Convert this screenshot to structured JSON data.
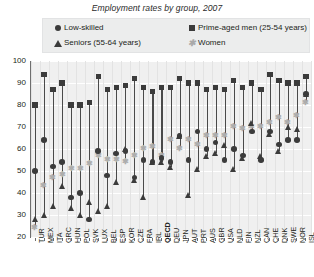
{
  "title": "Employment rates by group, 2007",
  "legend": {
    "position": "top",
    "items": [
      {
        "label": "Low-skilled",
        "marker": "circle-marker",
        "color": "#3b3b3b"
      },
      {
        "label": "Prime-aged men (25-54 years)",
        "marker": "square-marker",
        "color": "#3b3b3b"
      },
      {
        "label": "Seniors (55-64 years)",
        "marker": "triangle-marker",
        "color": "#3b3b3b"
      },
      {
        "label": "Women",
        "marker": "star-marker",
        "color": "#adadad"
      }
    ]
  },
  "yaxis": {
    "ticks": [
      "100",
      "90",
      "80",
      "70",
      "60",
      "50",
      "40",
      "30",
      "20"
    ],
    "min": 20,
    "max": 100
  },
  "chart_data": {
    "type": "scatter",
    "title": "Employment rates by group, 2007",
    "xlabel": "",
    "ylabel": "",
    "ylim": [
      20,
      100
    ],
    "grid": true,
    "legend_position": "top",
    "categories": [
      "TUR",
      "MEX",
      "ITA",
      "GRC",
      "HUN",
      "POL",
      "SVK",
      "LUX",
      "BEL",
      "ESP",
      "KOR",
      "CZE",
      "FRA",
      "IRL",
      "OECD",
      "DEU",
      "JPN",
      "AUT",
      "PRT",
      "AUS",
      "GBR",
      "USA",
      "NLD",
      "FIN",
      "NZL",
      "CAN",
      "CHE",
      "DNK",
      "SWE",
      "NOR",
      "ISL"
    ],
    "highlight_category": "OECD",
    "series": [
      {
        "name": "Low-skilled",
        "marker": "circle",
        "values": [
          50,
          64,
          52,
          54,
          38,
          40,
          28,
          59,
          48,
          58,
          59,
          47,
          55,
          54,
          56,
          54,
          66,
          55,
          68,
          60,
          63,
          55,
          60,
          57,
          68,
          55,
          68,
          62,
          64,
          64,
          85
        ]
      },
      {
        "name": "Prime-aged men (25-54 years)",
        "marker": "square",
        "values": [
          80,
          94,
          87,
          90,
          80,
          80,
          81,
          93,
          87,
          88,
          89,
          92,
          88,
          86,
          88,
          88,
          92,
          90,
          90,
          87,
          88,
          87,
          91,
          88,
          90,
          87,
          94,
          91,
          90,
          90,
          93
        ]
      },
      {
        "name": "Seniors (55-64 years)",
        "marker": "triangle",
        "values": [
          28,
          30,
          34,
          43,
          33,
          30,
          36,
          32,
          34,
          45,
          60,
          46,
          38,
          54,
          54,
          52,
          66,
          39,
          51,
          57,
          58,
          62,
          51,
          56,
          72,
          57,
          67,
          59,
          70,
          69,
          85
        ]
      },
      {
        "name": "Women",
        "marker": "star",
        "values": [
          24,
          43,
          47,
          48,
          51,
          51,
          53,
          57,
          55,
          55,
          54,
          57,
          60,
          61,
          57,
          64,
          60,
          64,
          62,
          66,
          66,
          66,
          70,
          69,
          70,
          70,
          72,
          74,
          72,
          75,
          81
        ]
      }
    ]
  }
}
